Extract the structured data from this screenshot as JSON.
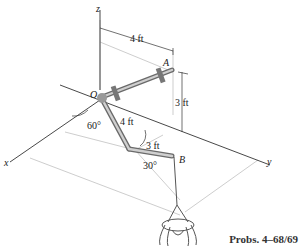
{
  "figure": {
    "caption": "Probs. 4–68/69",
    "axes": {
      "x": "x",
      "y": "y",
      "z": "z"
    },
    "points": {
      "origin": "O",
      "A": "A",
      "B": "B"
    },
    "dimensions": {
      "top_length": "4 ft",
      "height": "3 ft",
      "middle_length": "4 ft",
      "end_length": "3 ft"
    },
    "angles": {
      "base_angle": "60°",
      "end_angle": "30°"
    },
    "colors": {
      "line": "#333333",
      "pipe": "#8a8a8a",
      "construction": "#b0b0b0"
    }
  }
}
